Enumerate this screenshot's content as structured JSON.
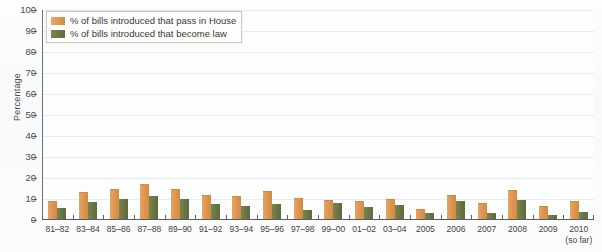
{
  "chart_data": {
    "type": "bar",
    "title": "",
    "xlabel": "",
    "ylabel": "Percentage",
    "ylim": [
      0,
      100
    ],
    "ytick_step": 10,
    "yticks": [
      100,
      90,
      80,
      70,
      60,
      50,
      40,
      30,
      20,
      10,
      0
    ],
    "grid": true,
    "legend_position": "top-left",
    "categories": [
      "81–82",
      "83–84",
      "85–86",
      "87–88",
      "89–90",
      "91–92",
      "93–94",
      "95–96",
      "97–98",
      "99–00",
      "01–02",
      "03–04",
      "2005",
      "2006",
      "2007",
      "2008",
      "2009",
      "2010"
    ],
    "category_sublabels": [
      "",
      "",
      "",
      "",
      "",
      "",
      "",
      "",
      "",
      "",
      "",
      "",
      "",
      "",
      "",
      "",
      "",
      "(so far)"
    ],
    "series": [
      {
        "name": "% of bills introduced that pass in House",
        "color": "#dd954c",
        "values": [
          8.5,
          13,
          14.5,
          16.5,
          14.5,
          11.5,
          11,
          13.5,
          10,
          9,
          8.5,
          9.5,
          5,
          11.5,
          7.5,
          14,
          6,
          8.5
        ]
      },
      {
        "name": "% of bills introduced that become law",
        "color": "#6a7545",
        "values": [
          5.5,
          8.5,
          10,
          11.5,
          10,
          7.5,
          6.8,
          7.5,
          5,
          8,
          6,
          7,
          3.5,
          9,
          3.5,
          9.5,
          2.5,
          4
        ]
      }
    ]
  },
  "legend": {
    "entries": [
      {
        "label": "% of bills introduced that pass in House"
      },
      {
        "label": "% of bills introduced that become law"
      }
    ]
  }
}
